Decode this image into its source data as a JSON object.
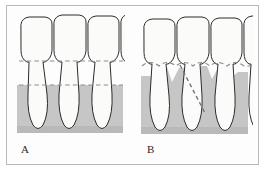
{
  "figure": {
    "type": "dental-illustration",
    "background_color": "#fdfdfd",
    "border_color": "#b9b9b9",
    "panels": [
      {
        "id": "A",
        "label": "A",
        "description": "Horizontal bone loss: alveolar bone crest is flat and parallel to the cemento-enamel junction line",
        "tooth_count": 4,
        "bone_pattern": "horizontal",
        "reference_lines": [
          {
            "name": "cemento-enamel-junction-line",
            "style": "dashed",
            "orientation": "horizontal",
            "color": "#8d8d94"
          },
          {
            "name": "bone-crest-line",
            "style": "dashed",
            "orientation": "horizontal",
            "color": "#8d8d94"
          }
        ]
      },
      {
        "id": "B",
        "label": "B",
        "description": "Vertical (angular) bone loss: bone crest is irregular with angular defects; diagonal dashed line marks the angular defect",
        "tooth_count": 4,
        "bone_pattern": "vertical-angular",
        "reference_lines": [
          {
            "name": "cemento-enamel-junction-line",
            "style": "dashed",
            "orientation": "scalloped",
            "color": "#8d8d94"
          },
          {
            "name": "angular-defect-line",
            "style": "dashed",
            "orientation": "diagonal",
            "color": "#6f6f76"
          }
        ]
      }
    ],
    "colors": {
      "tooth_fill": "#fbfbfa",
      "tooth_outline": "#2c2c2c",
      "bone_fill": "#c6c6c6",
      "bone_fill_dark": "#b6b6b6",
      "dashed_line": "#8d8d94",
      "label_text": "#2a2a2a"
    }
  }
}
